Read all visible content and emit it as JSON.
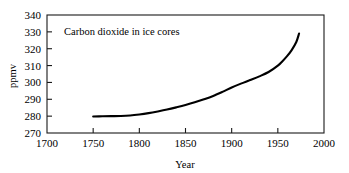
{
  "chart_data": {
    "type": "line",
    "title": "",
    "annotation": "Carbon dioxide in ice cores",
    "xlabel": "Year",
    "ylabel": "ppmv",
    "xlim": [
      1700,
      2000
    ],
    "ylim": [
      270,
      340
    ],
    "xticks": [
      1700,
      1750,
      1800,
      1850,
      1900,
      1950,
      2000
    ],
    "yticks": [
      270,
      280,
      290,
      300,
      310,
      320,
      330,
      340
    ],
    "xtick_labels": [
      "1700",
      "1750",
      "1800",
      "1850",
      "1900",
      "1950",
      "2000"
    ],
    "ytick_labels": [
      "270",
      "280",
      "290",
      "300",
      "310",
      "320",
      "330",
      "340"
    ],
    "grid": false,
    "legend": false,
    "line_color": "#000000",
    "frame_color": "#1a1a1a",
    "background": "#ffffff",
    "series": [
      {
        "name": "Carbon dioxide in ice cores",
        "x": [
          1750,
          1760,
          1770,
          1780,
          1790,
          1800,
          1810,
          1820,
          1830,
          1840,
          1850,
          1860,
          1870,
          1880,
          1890,
          1900,
          1910,
          1920,
          1930,
          1940,
          1950,
          1955,
          1960,
          1965,
          1970,
          1973
        ],
        "values": [
          279.8,
          279.9,
          280.0,
          280.1,
          280.4,
          281.0,
          281.8,
          282.8,
          283.9,
          285.2,
          286.6,
          288.2,
          290.0,
          292.0,
          294.4,
          297.0,
          299.3,
          301.4,
          303.6,
          306.2,
          310.0,
          312.6,
          315.6,
          319.2,
          324.0,
          329.0
        ]
      }
    ]
  },
  "geometry": {
    "plot_left": 47,
    "plot_right": 324,
    "plot_top": 15,
    "plot_bottom": 133
  }
}
